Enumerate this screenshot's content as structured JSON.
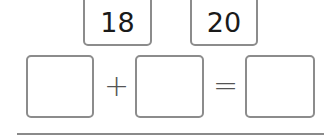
{
  "number_cards": [
    {
      "value": "18"
    },
    {
      "value": "20"
    }
  ],
  "equation": {
    "slots": [
      {
        "value": ""
      },
      {
        "value": ""
      },
      {
        "value": ""
      }
    ],
    "operators": {
      "plus": "+",
      "equals": "="
    }
  },
  "colors": {
    "box_border": "#8c8c8c",
    "text": "#1a1a1a",
    "rule": "#8a8a8a"
  }
}
